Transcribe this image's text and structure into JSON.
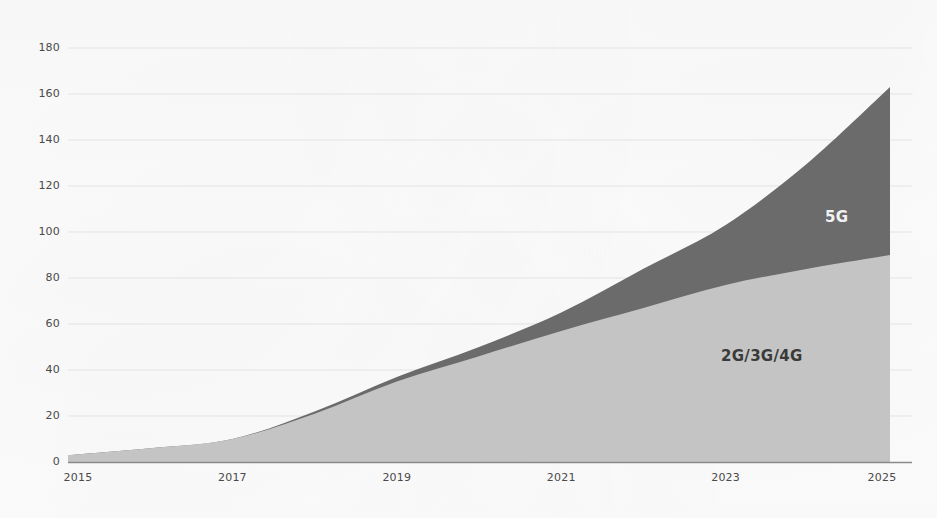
{
  "chart_data": {
    "type": "area",
    "stacked": true,
    "title": "",
    "subtitle": "",
    "xlabel": "",
    "ylabel": "",
    "x": [
      2015,
      2016,
      2017,
      2018,
      2019,
      2020,
      2021,
      2022,
      2023,
      2024,
      2025
    ],
    "xtick_labels": [
      "2015",
      "2017",
      "2019",
      "2021",
      "2023",
      "2025"
    ],
    "xtick_values": [
      2015,
      2017,
      2019,
      2021,
      2023,
      2025
    ],
    "ytick_labels": [
      "0",
      "20",
      "40",
      "60",
      "80",
      "100",
      "120",
      "140",
      "160",
      "180"
    ],
    "ytick_values": [
      0,
      20,
      40,
      60,
      80,
      100,
      120,
      140,
      160,
      180
    ],
    "xlim": [
      2015,
      2025
    ],
    "ylim": [
      0,
      188
    ],
    "grid": true,
    "grid_axis": "y",
    "legend": "inline-area-labels",
    "series": [
      {
        "name": "2G/3G/4G",
        "color": "#c4c4c4",
        "label_color": "#3a3a3a",
        "values": [
          3,
          6,
          10,
          21,
          35,
          46,
          57,
          67,
          77,
          84,
          90
        ]
      },
      {
        "name": "5G",
        "color": "#6b6b6b",
        "label_color": "#f2f2f2",
        "values": [
          0,
          0,
          0,
          1,
          2,
          4,
          8,
          17,
          26,
          46,
          73
        ]
      }
    ],
    "cumulative_totals": [
      3,
      6,
      10,
      22,
      37,
      50,
      65,
      84,
      103,
      130,
      163
    ],
    "annotations": [
      {
        "text": "5G",
        "x_px": 825,
        "y_px": 208,
        "color": "#f2f2f2"
      },
      {
        "text": "2G/3G/4G",
        "x_px": 781,
        "y_px": 347,
        "color": "#3a3a3a"
      }
    ]
  },
  "colors": {
    "background": "#fdfdfd",
    "grid": "#e3e3e3",
    "axis": "#8a8a8a",
    "tick_text": "#4a4a4a",
    "series_2g3g4g": "#c4c4c4",
    "series_5g": "#6b6b6b"
  }
}
